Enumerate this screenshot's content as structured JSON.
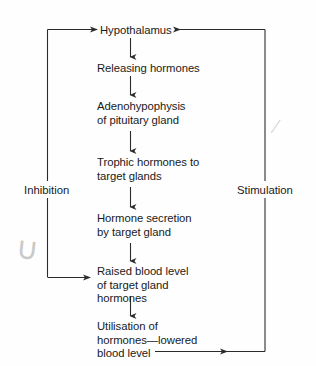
{
  "diagram": {
    "type": "flowchart",
    "background_color": "#fefefe",
    "line_color": "#2b2b2b",
    "text_color": "#1a1a1a",
    "nodes": [
      {
        "id": "hypothalamus",
        "lines": [
          "Hypothalamus"
        ],
        "x": 100,
        "y": 24
      },
      {
        "id": "releasing-hormones",
        "lines": [
          "Releasing hormones"
        ],
        "x": 97,
        "y": 62
      },
      {
        "id": "adenohypophysis",
        "lines": [
          "Adenohypophysis",
          "of pituitary gland"
        ],
        "x": 97,
        "y": 100
      },
      {
        "id": "trophic-hormones",
        "lines": [
          "Trophic hormones to",
          "target glands"
        ],
        "x": 97,
        "y": 156
      },
      {
        "id": "hormone-secretion",
        "lines": [
          "Hormone secretion",
          "by target gland"
        ],
        "x": 97,
        "y": 212
      },
      {
        "id": "raised-blood-level",
        "lines": [
          "Raised blood level",
          "of target gland",
          "hormones"
        ],
        "x": 97,
        "y": 265
      },
      {
        "id": "utilisation",
        "lines": [
          "Utilisation of",
          "hormones—lowered",
          "blood level"
        ],
        "x": 97,
        "y": 320
      }
    ],
    "side_labels": [
      {
        "id": "inhibition",
        "text": "Inhibition",
        "x": 21,
        "y": 184
      },
      {
        "id": "stimulation",
        "text": "Stimulation",
        "x": 234,
        "y": 184
      }
    ],
    "pencil_marks": [
      {
        "id": "loop-mark",
        "glyph": "∪",
        "x": 16,
        "y": 230
      },
      {
        "id": "slash-mark",
        "glyph": "⁄",
        "x": 274,
        "y": 116
      }
    ]
  }
}
